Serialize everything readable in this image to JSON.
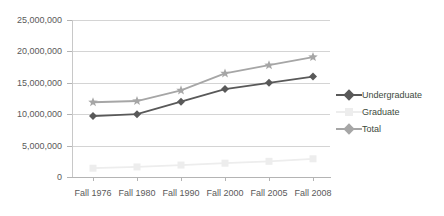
{
  "chart_data": {
    "type": "line",
    "title": "",
    "xlabel": "",
    "ylabel": "",
    "categories": [
      "Fall 1976",
      "Fall 1980",
      "Fall 1990",
      "Fall 2000",
      "Fall 2005",
      "Fall 2008"
    ],
    "ylim": [
      0,
      25000000
    ],
    "y_ticks": [
      0,
      5000000,
      10000000,
      15000000,
      20000000,
      25000000
    ],
    "y_tick_labels": [
      "0",
      "5,000,000",
      "10,000,000",
      "15,000,000",
      "20,000,000",
      "25,000,000"
    ],
    "grid": true,
    "legend_position": "right",
    "series": [
      {
        "name": "Undergraduate",
        "color": "#595959",
        "marker": "diamond",
        "values": [
          9700000,
          10000000,
          12000000,
          14000000,
          15000000,
          16000000
        ]
      },
      {
        "name": "Graduate",
        "color": "#ededed",
        "marker": "square",
        "values": [
          1400000,
          1600000,
          1900000,
          2200000,
          2500000,
          2900000
        ]
      },
      {
        "name": "Total",
        "color": "#a6a6a6",
        "marker": "star",
        "values": [
          11900000,
          12100000,
          13800000,
          16500000,
          17800000,
          19100000
        ]
      }
    ],
    "colors": {
      "undergraduate": "#595959",
      "graduate": "#ededed",
      "total": "#a6a6a6",
      "gridline": "#d4d4d4",
      "axis": "#b4b4b4",
      "text": "#5a5a5a",
      "legend_text": "#3d4a3d",
      "background": "#ffffff"
    }
  },
  "legend": {
    "items": [
      {
        "label": "Undergraduate"
      },
      {
        "label": "Graduate"
      },
      {
        "label": "Total"
      }
    ]
  }
}
